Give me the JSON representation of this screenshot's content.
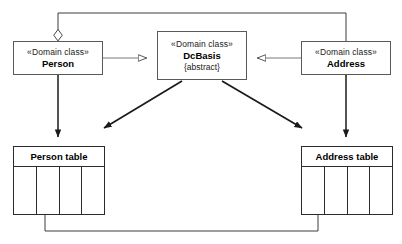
{
  "diagram": {
    "kind": "uml-class-to-table-mapping",
    "background_color": "#ffffff",
    "line_color": "#3c3c3c",
    "arrow_color": "#1a1a1a",
    "box_border_color": "#5a5a5a",
    "table_border_color": "#2b2b2b"
  },
  "classes": [
    {
      "id": "person",
      "stereotype": "«Domain class»",
      "name": "Person",
      "property": ""
    },
    {
      "id": "dcbasis",
      "stereotype": "«Domain class»",
      "name": "DcBasis",
      "property": "{abstract}"
    },
    {
      "id": "address",
      "stereotype": "«Domain class»",
      "name": "Address",
      "property": ""
    }
  ],
  "tables": [
    {
      "id": "person-table",
      "title": "Person table",
      "columns": [
        "",
        "",
        "",
        ""
      ],
      "marker": "filled-circle",
      "marker_column_index": 1
    },
    {
      "id": "address-table",
      "title": "Address table",
      "columns": [
        "",
        "",
        "",
        ""
      ],
      "marker": "up-arrowhead",
      "marker_column_index": 0
    }
  ],
  "connectors": [
    {
      "id": "person-aggregates-address",
      "from": "person",
      "to": "address",
      "type": "aggregation",
      "decoration": "hollow-diamond",
      "label": ""
    },
    {
      "id": "person-generalizes-dcbasis",
      "from": "person",
      "to": "dcbasis",
      "type": "generalization",
      "decoration": "hollow-triangle",
      "label": ""
    },
    {
      "id": "address-generalizes-dcbasis",
      "from": "address",
      "to": "dcbasis",
      "type": "generalization",
      "decoration": "hollow-triangle",
      "label": ""
    },
    {
      "id": "person-maps-to-person-table",
      "from": "person",
      "to": "person-table",
      "type": "mapping",
      "decoration": "solid-arrow",
      "label": ""
    },
    {
      "id": "address-maps-to-address-table",
      "from": "address",
      "to": "address-table",
      "type": "mapping",
      "decoration": "solid-arrow",
      "label": ""
    },
    {
      "id": "dcbasis-maps-to-person-table",
      "from": "dcbasis",
      "to": "person-table",
      "type": "mapping",
      "decoration": "solid-arrow",
      "label": ""
    },
    {
      "id": "dcbasis-maps-to-address-table",
      "from": "dcbasis",
      "to": "address-table",
      "type": "mapping",
      "decoration": "solid-arrow",
      "label": ""
    },
    {
      "id": "person-table-fk-address-table",
      "from": "person-table",
      "to": "address-table",
      "type": "foreign-key",
      "decoration": "solid-arrow",
      "label": ""
    }
  ]
}
